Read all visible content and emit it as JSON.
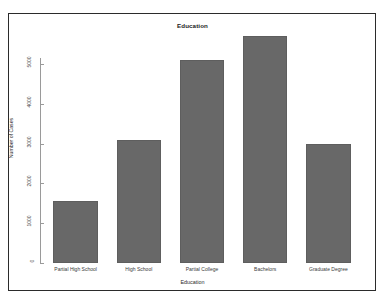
{
  "chart_data": {
    "type": "bar",
    "title": "Education",
    "xlabel": "Education",
    "ylabel": "Number of Cases",
    "categories": [
      "Partial High School",
      "High School",
      "Partial College",
      "Bachelors",
      "Graduate Degree"
    ],
    "values": [
      1550,
      3100,
      5100,
      5700,
      3000
    ],
    "ytick_labels": [
      "0",
      "1000",
      "2000",
      "3000",
      "4000",
      "5000"
    ],
    "ytick_values": [
      0,
      1000,
      2000,
      3000,
      4000,
      5000
    ],
    "ylim": [
      0,
      5800
    ],
    "grid": false,
    "legend": null,
    "bar_color": "#686868",
    "frame_color": "#2b2b2b",
    "axis_color": "#9a9a9a"
  }
}
